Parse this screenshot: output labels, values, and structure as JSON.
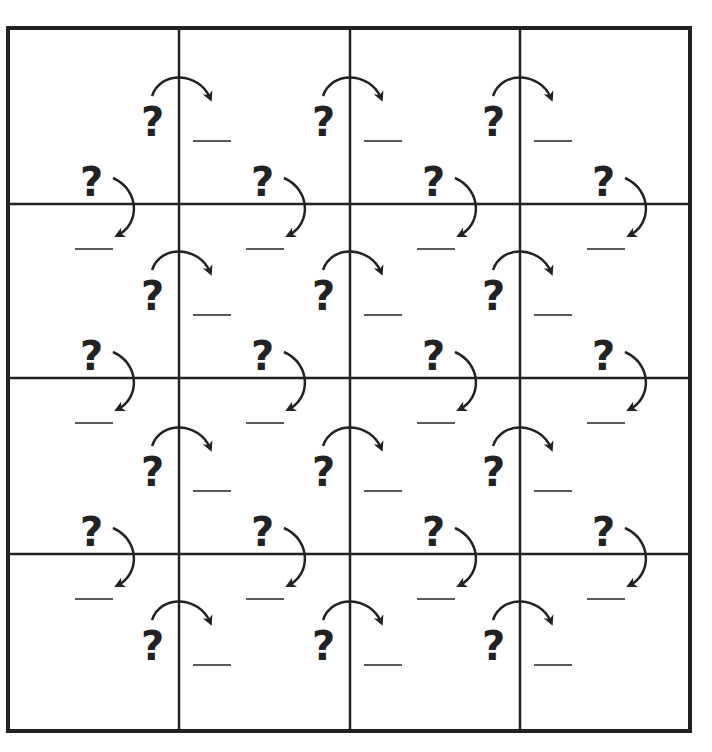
{
  "puzzle": {
    "rows": 4,
    "cols": 4,
    "grid": {
      "left": 8,
      "top": 28,
      "right": 690,
      "bottom": 731,
      "col_lines": [
        179,
        350,
        520
      ],
      "row_lines": [
        204,
        378,
        554
      ],
      "line_color": "#222222",
      "outer_width": 4,
      "inner_width": 2.5
    },
    "clue_symbol": "?",
    "blank_symbol": "___",
    "horizontal_clues": {
      "description": "clue '?' left of each vertical grid line, curved arrow crossing to a blank on the right",
      "band_centers_y": [
        118,
        292,
        468,
        642
      ],
      "items_per_band": 3
    },
    "vertical_clues": {
      "description": "clue '?' above each horizontal grid line, curved arrow crossing down to a blank below",
      "column_offsets_x": [
        92,
        263,
        434,
        604
      ],
      "items_per_line": 4
    }
  }
}
